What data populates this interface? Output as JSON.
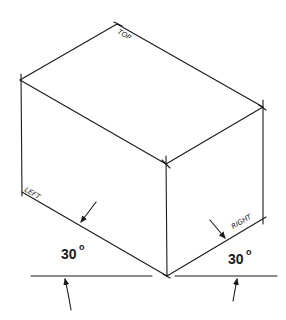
{
  "diagram": {
    "face_labels": {
      "top": "TOP",
      "left": "LEFT",
      "right": "RIGHT"
    },
    "angles": {
      "left": {
        "value": "30",
        "unit": "o"
      },
      "right": {
        "value": "30",
        "unit": "o"
      }
    },
    "colors": {
      "line": "#1a1a1a",
      "background": "#ffffff"
    }
  }
}
